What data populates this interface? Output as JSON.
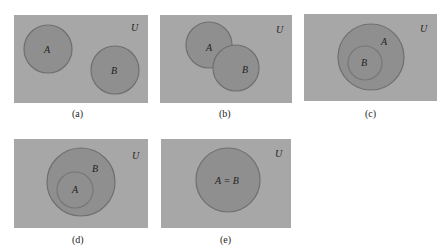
{
  "panels": [
    {
      "caption": "(a)",
      "universe_label": "U",
      "relation": "disjoint",
      "sets": [
        {
          "label": "A"
        },
        {
          "label": "B"
        }
      ]
    },
    {
      "caption": "(b)",
      "universe_label": "U",
      "relation": "overlapping",
      "sets": [
        {
          "label": "A"
        },
        {
          "label": "B"
        }
      ]
    },
    {
      "caption": "(c)",
      "universe_label": "U",
      "relation": "B subset of A",
      "sets": [
        {
          "label": "A"
        },
        {
          "label": "B"
        }
      ]
    },
    {
      "caption": "(d)",
      "universe_label": "U",
      "relation": "A subset of B",
      "sets": [
        {
          "label": "B"
        },
        {
          "label": "A"
        }
      ]
    },
    {
      "caption": "(e)",
      "universe_label": "U",
      "relation": "equal",
      "sets": [
        {
          "label": "A = B"
        }
      ]
    }
  ],
  "colors": {
    "universe": "#a7a7a7",
    "set_fill": "#8f8f8f",
    "set_stroke": "#6f6f6f"
  }
}
